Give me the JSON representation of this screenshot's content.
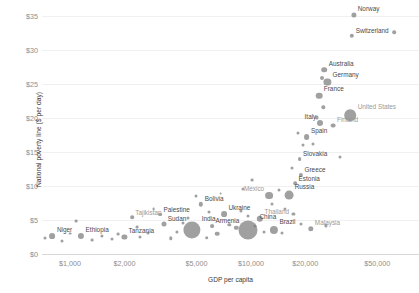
{
  "chart_data": {
    "type": "scatter",
    "title": "",
    "xlabel": "GDP per capita",
    "ylabel": "National poverty line ($ per day)",
    "x_scale": "log",
    "y_scale": "linear",
    "xlim": [
      700,
      85000
    ],
    "ylim": [
      0,
      36.5
    ],
    "grid": "horizontal-faint",
    "legend": "none",
    "bubble_encoding": "population",
    "x_ticks": [
      {
        "value": 1000,
        "label": "$1,000"
      },
      {
        "value": 2000,
        "label": "$2,000"
      },
      {
        "value": 5000,
        "label": "$5,000"
      },
      {
        "value": 10000,
        "label": "$10,000"
      },
      {
        "value": 20000,
        "label": "$20,000"
      },
      {
        "value": 50000,
        "label": "$50,000"
      }
    ],
    "y_ticks": [
      {
        "value": 0,
        "label": "$0"
      },
      {
        "value": 5,
        "label": "$5"
      },
      {
        "value": 10,
        "label": "$10"
      },
      {
        "value": 15,
        "label": "$15"
      },
      {
        "value": 20,
        "label": "$20"
      },
      {
        "value": 25,
        "label": "$25"
      },
      {
        "value": 30,
        "label": "$30"
      },
      {
        "value": 35,
        "label": "$35"
      }
    ],
    "points": [
      {
        "name": "Norway",
        "x": 37000,
        "y": 35.2,
        "r": 2.6,
        "label": "Norway",
        "pos": "right",
        "tone": "dark"
      },
      {
        "name": "Switzerland",
        "x": 36200,
        "y": 32.1,
        "r": 2.2,
        "label": "Switzerland",
        "pos": "right",
        "tone": "dark"
      },
      {
        "name": "unlabeled-1",
        "x": 62000,
        "y": 32.6,
        "r": 1.8,
        "label": "",
        "pos": "none",
        "tone": "dark"
      },
      {
        "name": "Australia",
        "x": 25500,
        "y": 27.1,
        "r": 2.8,
        "label": "Australia",
        "pos": "right",
        "tone": "dark"
      },
      {
        "name": "Germany",
        "x": 26500,
        "y": 25.3,
        "r": 3.6,
        "label": "Germany",
        "pos": "right",
        "tone": "dark"
      },
      {
        "name": "unlabeled-2",
        "x": 24600,
        "y": 25.9,
        "r": 2.0,
        "label": "",
        "pos": "none",
        "tone": "dark"
      },
      {
        "name": "France",
        "x": 23800,
        "y": 23.3,
        "r": 3.3,
        "label": "France",
        "pos": "right",
        "tone": "dark"
      },
      {
        "name": "unlabeled-3",
        "x": 25200,
        "y": 21.6,
        "r": 1.7,
        "label": "",
        "pos": "none",
        "tone": "dark"
      },
      {
        "name": "United States",
        "x": 35500,
        "y": 20.4,
        "r": 5.8,
        "label": "United States",
        "pos": "right",
        "tone": "light"
      },
      {
        "name": "Italy",
        "x": 24200,
        "y": 19.3,
        "r": 3.0,
        "label": "Italy",
        "pos": "left",
        "tone": "dark"
      },
      {
        "name": "Finland",
        "x": 28500,
        "y": 18.9,
        "r": 2.4,
        "label": "Finland",
        "pos": "right",
        "tone": "light"
      },
      {
        "name": "unlabeled-4",
        "x": 23100,
        "y": 20.1,
        "r": 1.6,
        "label": "",
        "pos": "none",
        "tone": "dark"
      },
      {
        "name": "Spain",
        "x": 20300,
        "y": 17.2,
        "r": 2.9,
        "label": "Spain",
        "pos": "right",
        "tone": "dark"
      },
      {
        "name": "Slovakia",
        "x": 18600,
        "y": 14.0,
        "r": 1.9,
        "label": "Slovakia",
        "pos": "right",
        "tone": "dark"
      },
      {
        "name": "unlabeled-5",
        "x": 19400,
        "y": 16.0,
        "r": 1.5,
        "label": "",
        "pos": "none",
        "tone": "dark"
      },
      {
        "name": "Greece",
        "x": 18900,
        "y": 11.6,
        "r": 2.1,
        "label": "Greece",
        "pos": "right",
        "tone": "dark"
      },
      {
        "name": "Estonia",
        "x": 17600,
        "y": 10.4,
        "r": 1.8,
        "label": "Estonia",
        "pos": "right",
        "tone": "dark"
      },
      {
        "name": "Russia",
        "x": 16200,
        "y": 8.7,
        "r": 4.4,
        "label": "Russia",
        "pos": "right",
        "tone": "dark"
      },
      {
        "name": "Mexico",
        "x": 12600,
        "y": 8.6,
        "r": 3.9,
        "label": "Mexico",
        "pos": "left",
        "tone": "light"
      },
      {
        "name": "unlabeled-6",
        "x": 14300,
        "y": 9.4,
        "r": 1.5,
        "label": "",
        "pos": "none",
        "tone": "dark"
      },
      {
        "name": "unlabeled-7",
        "x": 13100,
        "y": 7.3,
        "r": 1.5,
        "label": "",
        "pos": "none",
        "tone": "dark"
      },
      {
        "name": "unlabeled-8",
        "x": 15400,
        "y": 6.6,
        "r": 1.6,
        "label": "",
        "pos": "none",
        "tone": "dark"
      },
      {
        "name": "Bolivia",
        "x": 5300,
        "y": 7.3,
        "r": 2.2,
        "label": "Bolivia",
        "pos": "right",
        "tone": "dark"
      },
      {
        "name": "Palestine",
        "x": 3150,
        "y": 5.8,
        "r": 1.9,
        "label": "Palestine",
        "pos": "right",
        "tone": "dark"
      },
      {
        "name": "Ukraine",
        "x": 7100,
        "y": 5.9,
        "r": 2.9,
        "label": "Ukraine",
        "pos": "right",
        "tone": "dark"
      },
      {
        "name": "Thailand",
        "x": 11200,
        "y": 5.2,
        "r": 3.2,
        "label": "Thailand",
        "pos": "right",
        "tone": "light"
      },
      {
        "name": "Armenia",
        "x": 6100,
        "y": 4.1,
        "r": 1.9,
        "label": "Armenia",
        "pos": "right",
        "tone": "dark"
      },
      {
        "name": "China",
        "x": 9700,
        "y": 3.6,
        "r": 9.5,
        "label": "China",
        "pos": "right",
        "tone": "dark"
      },
      {
        "name": "India",
        "x": 4700,
        "y": 3.5,
        "r": 8.6,
        "label": "India",
        "pos": "right",
        "tone": "dark"
      },
      {
        "name": "Brazil",
        "x": 13400,
        "y": 3.6,
        "r": 4.1,
        "label": "Brazil",
        "pos": "right",
        "tone": "dark"
      },
      {
        "name": "Malaysia",
        "x": 21400,
        "y": 3.7,
        "r": 2.7,
        "label": "Malaysia",
        "pos": "right",
        "tone": "light"
      },
      {
        "name": "Sudan",
        "x": 3300,
        "y": 4.4,
        "r": 2.5,
        "label": "Sudan",
        "pos": "right",
        "tone": "dark"
      },
      {
        "name": "Tajikistan",
        "x": 2200,
        "y": 5.4,
        "r": 1.8,
        "label": "Tajikistan",
        "pos": "right",
        "tone": "light"
      },
      {
        "name": "Tanzania",
        "x": 2000,
        "y": 2.5,
        "r": 2.6,
        "label": "Tanzania",
        "pos": "right",
        "tone": "dark"
      },
      {
        "name": "Ethiopia",
        "x": 1150,
        "y": 2.7,
        "r": 3.1,
        "label": "Ethiopia",
        "pos": "right",
        "tone": "dark"
      },
      {
        "name": "Niger",
        "x": 800,
        "y": 2.6,
        "r": 2.9,
        "label": "Niger",
        "pos": "right",
        "tone": "dark"
      },
      {
        "name": "unlabeled-9",
        "x": 730,
        "y": 2.4,
        "r": 1.5,
        "label": "",
        "pos": "none",
        "tone": "dark"
      },
      {
        "name": "unlabeled-10",
        "x": 900,
        "y": 1.9,
        "r": 1.5,
        "label": "",
        "pos": "none",
        "tone": "dark"
      },
      {
        "name": "unlabeled-11",
        "x": 1000,
        "y": 3.0,
        "r": 1.4,
        "label": "",
        "pos": "none",
        "tone": "dark"
      },
      {
        "name": "unlabeled-12",
        "x": 1320,
        "y": 2.0,
        "r": 1.4,
        "label": "",
        "pos": "none",
        "tone": "dark"
      },
      {
        "name": "unlabeled-13",
        "x": 1500,
        "y": 2.7,
        "r": 1.6,
        "label": "",
        "pos": "none",
        "tone": "dark"
      },
      {
        "name": "unlabeled-14",
        "x": 1700,
        "y": 2.2,
        "r": 1.5,
        "label": "",
        "pos": "none",
        "tone": "dark"
      },
      {
        "name": "unlabeled-15",
        "x": 1850,
        "y": 2.9,
        "r": 1.4,
        "label": "",
        "pos": "none",
        "tone": "dark"
      },
      {
        "name": "unlabeled-16",
        "x": 2450,
        "y": 2.5,
        "r": 1.5,
        "label": "",
        "pos": "none",
        "tone": "dark"
      },
      {
        "name": "unlabeled-17",
        "x": 2700,
        "y": 3.1,
        "r": 1.5,
        "label": "",
        "pos": "none",
        "tone": "dark"
      },
      {
        "name": "unlabeled-18",
        "x": 3600,
        "y": 2.3,
        "r": 1.7,
        "label": "",
        "pos": "none",
        "tone": "dark"
      },
      {
        "name": "unlabeled-19",
        "x": 3900,
        "y": 3.2,
        "r": 1.6,
        "label": "",
        "pos": "none",
        "tone": "dark"
      },
      {
        "name": "unlabeled-20",
        "x": 5700,
        "y": 2.4,
        "r": 1.8,
        "label": "",
        "pos": "none",
        "tone": "dark"
      },
      {
        "name": "unlabeled-21",
        "x": 6500,
        "y": 3.0,
        "r": 2.3,
        "label": "",
        "pos": "none",
        "tone": "dark"
      },
      {
        "name": "unlabeled-22",
        "x": 7600,
        "y": 4.3,
        "r": 1.7,
        "label": "",
        "pos": "none",
        "tone": "dark"
      },
      {
        "name": "unlabeled-23",
        "x": 8300,
        "y": 3.9,
        "r": 2.2,
        "label": "",
        "pos": "none",
        "tone": "dark"
      },
      {
        "name": "unlabeled-24",
        "x": 4200,
        "y": 4.6,
        "r": 1.5,
        "label": "",
        "pos": "none",
        "tone": "dark"
      },
      {
        "name": "unlabeled-25",
        "x": 4500,
        "y": 5.3,
        "r": 1.5,
        "label": "",
        "pos": "none",
        "tone": "dark"
      },
      {
        "name": "unlabeled-26",
        "x": 5900,
        "y": 6.2,
        "r": 1.5,
        "label": "",
        "pos": "none",
        "tone": "dark"
      },
      {
        "name": "unlabeled-27",
        "x": 8800,
        "y": 6.4,
        "r": 1.6,
        "label": "",
        "pos": "none",
        "tone": "dark"
      },
      {
        "name": "unlabeled-28",
        "x": 9600,
        "y": 5.6,
        "r": 1.5,
        "label": "",
        "pos": "none",
        "tone": "dark"
      },
      {
        "name": "unlabeled-29",
        "x": 10600,
        "y": 4.1,
        "r": 1.5,
        "label": "",
        "pos": "none",
        "tone": "dark"
      },
      {
        "name": "unlabeled-30",
        "x": 11800,
        "y": 3.2,
        "r": 1.5,
        "label": "",
        "pos": "none",
        "tone": "dark"
      },
      {
        "name": "unlabeled-31",
        "x": 5000,
        "y": 8.6,
        "r": 1.5,
        "label": "",
        "pos": "none",
        "tone": "dark"
      },
      {
        "name": "unlabeled-32",
        "x": 6800,
        "y": 8.9,
        "r": 1.4,
        "label": "",
        "pos": "none",
        "tone": "dark"
      },
      {
        "name": "unlabeled-33",
        "x": 9000,
        "y": 9.5,
        "r": 1.5,
        "label": "",
        "pos": "none",
        "tone": "dark"
      },
      {
        "name": "unlabeled-34",
        "x": 10200,
        "y": 10.9,
        "r": 1.4,
        "label": "",
        "pos": "none",
        "tone": "dark"
      },
      {
        "name": "unlabeled-35",
        "x": 16800,
        "y": 12.6,
        "r": 1.5,
        "label": "",
        "pos": "none",
        "tone": "dark"
      },
      {
        "name": "unlabeled-36",
        "x": 18200,
        "y": 17.8,
        "r": 1.5,
        "label": "",
        "pos": "none",
        "tone": "dark"
      },
      {
        "name": "unlabeled-37",
        "x": 22000,
        "y": 16.2,
        "r": 1.5,
        "label": "",
        "pos": "none",
        "tone": "dark"
      },
      {
        "name": "unlabeled-38",
        "x": 2900,
        "y": 6.6,
        "r": 1.4,
        "label": "",
        "pos": "none",
        "tone": "dark"
      },
      {
        "name": "unlabeled-39",
        "x": 17200,
        "y": 5.9,
        "r": 1.6,
        "label": "",
        "pos": "none",
        "tone": "dark"
      },
      {
        "name": "unlabeled-40",
        "x": 19000,
        "y": 4.4,
        "r": 1.5,
        "label": "",
        "pos": "none",
        "tone": "dark"
      },
      {
        "name": "unlabeled-41",
        "x": 26000,
        "y": 4.2,
        "r": 1.6,
        "label": "",
        "pos": "none",
        "tone": "dark"
      },
      {
        "name": "unlabeled-42",
        "x": 31000,
        "y": 14.3,
        "r": 1.5,
        "label": "",
        "pos": "none",
        "tone": "dark"
      },
      {
        "name": "unlabeled-43",
        "x": 1080,
        "y": 4.9,
        "r": 1.4,
        "label": "",
        "pos": "none",
        "tone": "dark"
      },
      {
        "name": "unlabeled-44",
        "x": 2350,
        "y": 4.0,
        "r": 1.4,
        "label": "",
        "pos": "none",
        "tone": "dark"
      },
      {
        "name": "unlabeled-45",
        "x": 14800,
        "y": 3.1,
        "r": 1.5,
        "label": "",
        "pos": "none",
        "tone": "dark"
      }
    ]
  }
}
